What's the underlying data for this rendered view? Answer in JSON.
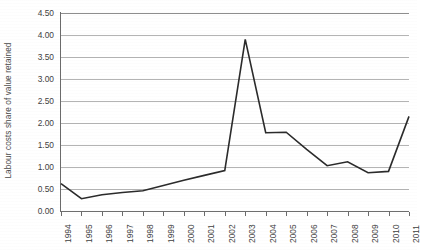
{
  "chart_data": {
    "type": "line",
    "title": "",
    "xlabel": "",
    "ylabel": "Labour costs share of value retained",
    "categories": [
      "1994",
      "1995",
      "1996",
      "1997",
      "1998",
      "1999",
      "2000",
      "2001",
      "2002",
      "2003",
      "2004",
      "2005",
      "2006",
      "2007",
      "2008",
      "2009",
      "2010",
      "2011"
    ],
    "values": [
      0.62,
      0.28,
      0.37,
      0.42,
      0.46,
      0.58,
      0.7,
      0.81,
      0.92,
      3.9,
      1.78,
      1.79,
      1.4,
      1.03,
      1.12,
      0.87,
      0.9,
      2.15
    ],
    "series": [
      {
        "name": "Labour costs share of value retained",
        "values": [
          0.62,
          0.28,
          0.37,
          0.42,
          0.46,
          0.58,
          0.7,
          0.81,
          0.92,
          3.9,
          1.78,
          1.79,
          1.4,
          1.03,
          1.12,
          0.87,
          0.9,
          2.15
        ]
      }
    ],
    "ylim": [
      0.0,
      4.5
    ],
    "ytick_labels": [
      "4.50",
      "4.00",
      "3.50",
      "3.00",
      "2.50",
      "2.00",
      "1.50",
      "1.00",
      "0.50",
      "0.00"
    ],
    "ytick_values": [
      4.5,
      4.0,
      3.5,
      3.0,
      2.5,
      2.0,
      1.5,
      1.0,
      0.5,
      0.0
    ],
    "ytick_step": 0.5,
    "grid": true,
    "grid_axis": "y",
    "legend": false,
    "legend_position": "none",
    "line_color": "#2b2b2b",
    "grid_color": "#b4b4b4",
    "axis_color": "#6b6b6b",
    "markers": false,
    "annotations": []
  }
}
